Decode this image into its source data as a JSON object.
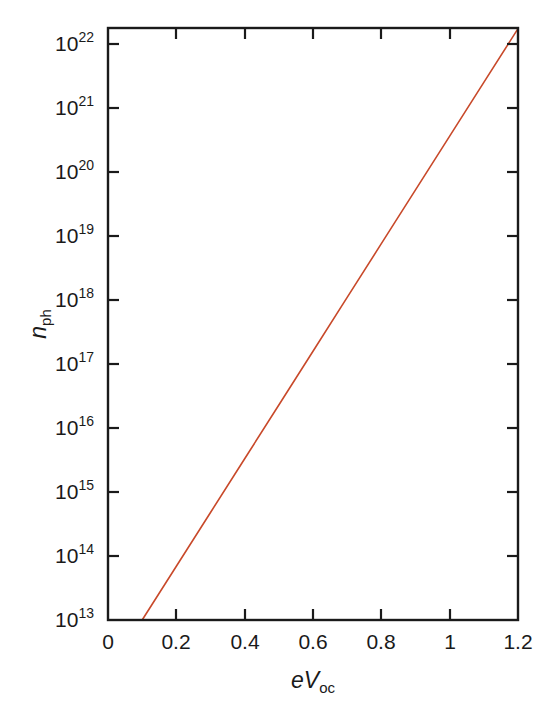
{
  "chart_data": {
    "type": "line",
    "title": "",
    "subtitle": "",
    "xlabel": "eVoc",
    "xlabel_parts": {
      "italic_e": "e",
      "italic_V": "V",
      "subscript": "oc"
    },
    "ylabel": "nph",
    "ylabel_parts": {
      "italic_n": "n",
      "subscript": "ph"
    },
    "xscale": "linear",
    "yscale": "log",
    "xlim": [
      0,
      1.2
    ],
    "ylim": [
      10000000000000.0,
      1.8e+22
    ],
    "grid": false,
    "legend": null,
    "xticks": [
      0,
      0.2,
      0.4,
      0.6,
      0.8,
      1,
      1.2
    ],
    "xtick_labels": [
      "0",
      "0.2",
      "0.4",
      "0.6",
      "0.8",
      "1",
      "1.2"
    ],
    "ytick_exponents": [
      13,
      14,
      15,
      16,
      17,
      18,
      19,
      20,
      21,
      22
    ],
    "ytick_labels": [
      "10^13",
      "10^14",
      "10^15",
      "10^16",
      "10^17",
      "10^18",
      "10^19",
      "10^20",
      "10^21",
      "10^22"
    ],
    "ytick_mantissa": "10",
    "series": [
      {
        "name": "n_ph vs eV_oc",
        "color": "#c8492a",
        "linewidth": 1.6,
        "x": [
          0.1,
          0.2,
          0.3,
          0.4,
          0.5,
          0.6,
          0.7,
          0.8,
          0.9,
          1.0,
          1.1,
          1.2
        ],
        "y_exponent": [
          13.0,
          13.84,
          14.68,
          15.52,
          16.36,
          17.2,
          18.04,
          18.88,
          19.72,
          20.56,
          21.4,
          22.24
        ],
        "y": [
          10000000000000.0,
          69000000000000.0,
          480000000000000.0,
          3300000000000000.0,
          2.3e+16,
          1.6e+17,
          1.1e+18,
          7.6e+18,
          5.2e+19,
          3.6e+20,
          2.5e+21,
          1.7e+22
        ]
      }
    ],
    "axes_style": {
      "frame": "full-box",
      "tick_direction": "in",
      "frame_color": "#1a1a1a",
      "background": "#ffffff"
    }
  },
  "ticks": {
    "y": [
      {
        "exp": "22",
        "y": 44
      },
      {
        "exp": "21",
        "y": 108
      },
      {
        "exp": "20",
        "y": 172
      },
      {
        "exp": "19",
        "y": 236
      },
      {
        "exp": "18",
        "y": 300
      },
      {
        "exp": "17",
        "y": 364
      },
      {
        "exp": "16",
        "y": 428
      },
      {
        "exp": "15",
        "y": 492
      },
      {
        "exp": "14",
        "y": 556
      },
      {
        "exp": "13",
        "y": 620
      }
    ],
    "x": [
      {
        "label": "0",
        "x": 108
      },
      {
        "label": "0.2",
        "x": 176
      },
      {
        "label": "0.4",
        "x": 245
      },
      {
        "label": "0.6",
        "x": 313
      },
      {
        "label": "0.8",
        "x": 381
      },
      {
        "label": "1",
        "x": 450
      },
      {
        "label": "1.2",
        "x": 518
      }
    ]
  }
}
